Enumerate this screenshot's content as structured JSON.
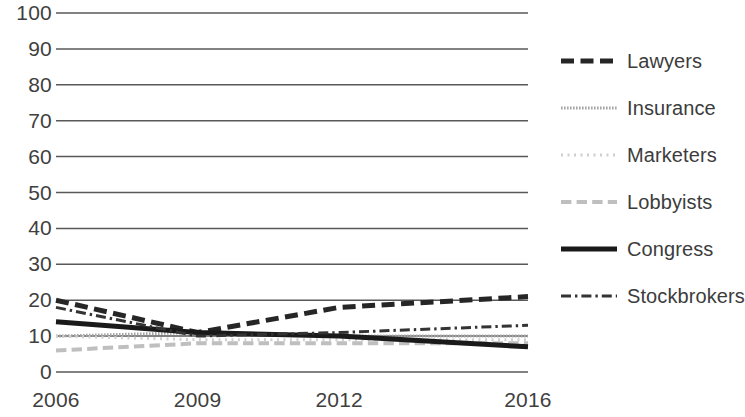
{
  "chart_data": {
    "type": "line",
    "title": "",
    "subtitle": "",
    "xlabel": "",
    "ylabel": "",
    "x": [
      2006,
      2009,
      2012,
      2016
    ],
    "categories": [
      "2006",
      "2009",
      "2012",
      "2016"
    ],
    "ylim": [
      0,
      100
    ],
    "yticks": [
      0,
      10,
      20,
      30,
      40,
      50,
      60,
      70,
      80,
      90,
      100
    ],
    "ytick_labels": [
      "0",
      "10",
      "20",
      "30",
      "40",
      "50",
      "60",
      "70",
      "80",
      "90",
      "100"
    ],
    "xtick_labels": [
      "2006",
      "2009",
      "2012",
      "2016"
    ],
    "grid": true,
    "grid_axis": "y",
    "legend_position": "right",
    "series": [
      {
        "name": "Lawyers",
        "values": [
          20,
          11,
          18,
          21
        ],
        "style": "dashed",
        "color": "#262626",
        "width": 5
      },
      {
        "name": "Insurance",
        "values": [
          10,
          11,
          10,
          10
        ],
        "style": "fine-dotted",
        "color": "#a6a6a6",
        "width": 3
      },
      {
        "name": "Marketers",
        "values": [
          10,
          9,
          9,
          9
        ],
        "style": "dotted",
        "color": "#cfcfcf",
        "width": 3
      },
      {
        "name": "Lobbyists",
        "values": [
          6,
          8,
          8,
          8
        ],
        "style": "dashed",
        "color": "#bfbfbf",
        "width": 4
      },
      {
        "name": "Congress",
        "values": [
          14,
          11,
          10,
          7
        ],
        "style": "solid",
        "color": "#1a1a1a",
        "width": 5
      },
      {
        "name": "Stockbrokers",
        "values": [
          18,
          10,
          11,
          13
        ],
        "style": "dash-dot",
        "color": "#333333",
        "width": 3
      }
    ]
  },
  "legend": {
    "items": [
      {
        "label": "Lawyers"
      },
      {
        "label": "Insurance"
      },
      {
        "label": "Marketers"
      },
      {
        "label": "Lobbyists"
      },
      {
        "label": "Congress"
      },
      {
        "label": "Stockbrokers"
      }
    ]
  },
  "colors": {
    "grid": "#595959",
    "text": "#3f3f3f",
    "background": "#ffffff"
  }
}
